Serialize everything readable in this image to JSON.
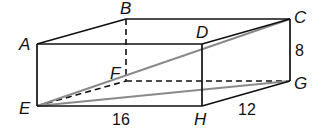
{
  "diagram": {
    "type": "rectangular-prism",
    "vertices": {
      "A": {
        "label": "A",
        "x": 37,
        "y": 44
      },
      "B": {
        "label": "B",
        "x": 126,
        "y": 19
      },
      "C": {
        "label": "C",
        "x": 290,
        "y": 19
      },
      "D": {
        "label": "D",
        "x": 202,
        "y": 44
      },
      "E": {
        "label": "E",
        "x": 37,
        "y": 106
      },
      "F": {
        "label": "F",
        "x": 126,
        "y": 81
      },
      "G": {
        "label": "G",
        "x": 290,
        "y": 81
      },
      "H": {
        "label": "H",
        "x": 202,
        "y": 106
      }
    },
    "dimensions": {
      "length": "16",
      "width": "12",
      "height": "8"
    },
    "colors": {
      "edge": "#111111",
      "diagonal": "#8a8a8a"
    }
  }
}
